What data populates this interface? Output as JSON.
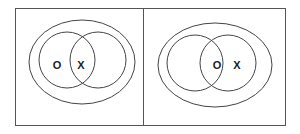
{
  "panels": [
    {
      "name": "left-panel",
      "labels": [
        {
          "text": "O",
          "region": "left-circle-only"
        },
        {
          "text": "X",
          "region": "intersection"
        }
      ]
    },
    {
      "name": "right-panel",
      "labels": [
        {
          "text": "O",
          "region": "intersection"
        },
        {
          "text": "X",
          "region": "right-circle-only"
        }
      ]
    }
  ],
  "colors": {
    "stroke": "#444444",
    "background": "#ffffff"
  }
}
